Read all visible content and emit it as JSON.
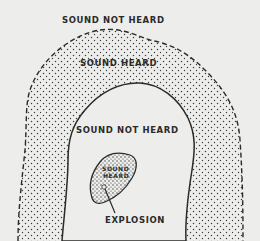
{
  "diagram": {
    "title": "",
    "labels": {
      "outer_not_heard": "SOUND NOT HEARD",
      "ring_heard": "SOUND HEARD",
      "inner_not_heard": "SOUND NOT HEARD",
      "core_heard_line1": "SOUND",
      "core_heard_line2": "HEARD",
      "explosion": "EXPLOSION"
    },
    "colors": {
      "background": "#ededeb",
      "ink": "#2a2a2a",
      "stipple": "#3a3a3a"
    }
  }
}
